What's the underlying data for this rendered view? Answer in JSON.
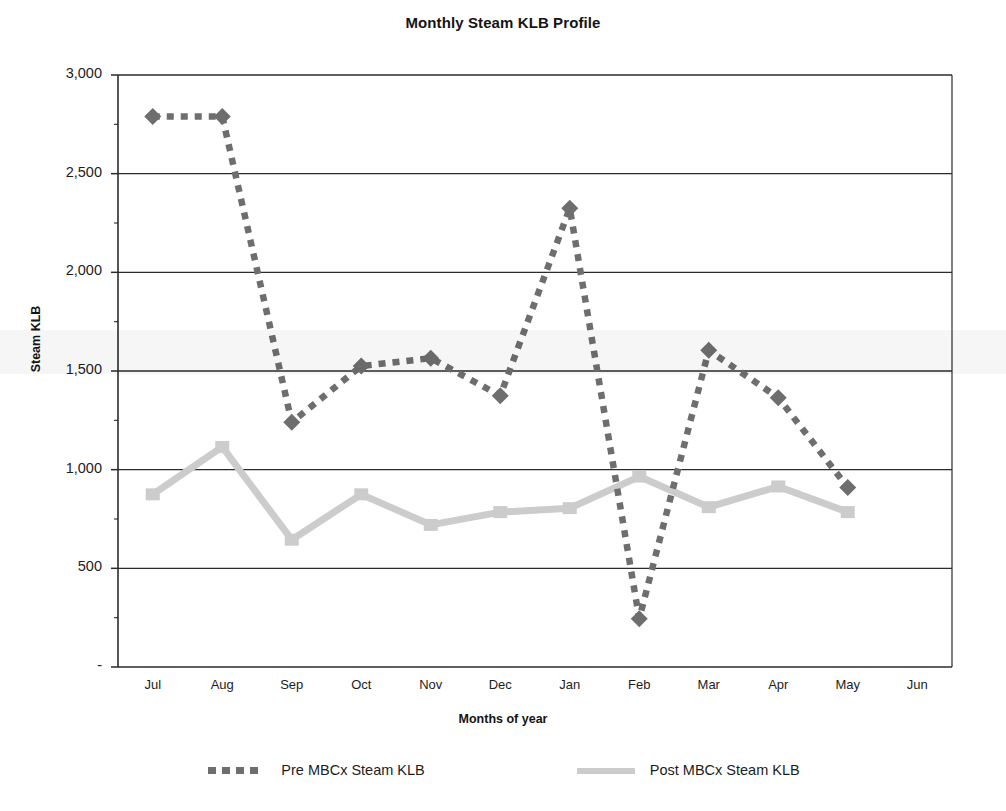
{
  "chart_data": {
    "type": "line",
    "title": "Monthly Steam KLB Profile",
    "xlabel": "Months of year",
    "ylabel": "Steam KLB",
    "categories": [
      "Jul",
      "Aug",
      "Sep",
      "Oct",
      "Nov",
      "Dec",
      "Jan",
      "Feb",
      "Mar",
      "Apr",
      "May",
      "Jun"
    ],
    "ylim": [
      0,
      3000
    ],
    "ytick_values": [
      0,
      500,
      1000,
      1500,
      2000,
      2500,
      3000
    ],
    "ytick_labels": [
      "-",
      "500",
      "1,000",
      "1,500",
      "2,000",
      "2,500",
      "3,000"
    ],
    "grid": true,
    "grid_axis": "y",
    "legend_position": "bottom",
    "series": [
      {
        "name": "Pre MBCx Steam KLB",
        "color": "#6e6e6e",
        "style": "dotted",
        "marker": "diamond",
        "values": [
          2790,
          2790,
          1240,
          1525,
          1565,
          1375,
          2325,
          245,
          1605,
          1365,
          910,
          null
        ]
      },
      {
        "name": "Post MBCx Steam KLB",
        "color": "#cccccc",
        "style": "solid",
        "marker": "square",
        "values": [
          875,
          1115,
          645,
          875,
          720,
          785,
          805,
          965,
          810,
          915,
          785,
          null
        ]
      }
    ]
  },
  "chart": {
    "title": "Monthly Steam KLB Profile",
    "x_axis_title": "Months of year",
    "y_axis_title": "Steam KLB"
  },
  "legend": {
    "items": [
      {
        "label": "Pre MBCx Steam KLB",
        "swatch": "dotted-gray-swatch"
      },
      {
        "label": "Post MBCx Steam KLB",
        "swatch": "solid-lightgray-swatch"
      }
    ]
  },
  "axis": {
    "y_ticks": [
      "3,000",
      "2,500",
      "2,000",
      "1,500",
      "1,000",
      "500",
      "-"
    ],
    "x_ticks": [
      "Jul",
      "Aug",
      "Sep",
      "Oct",
      "Nov",
      "Dec",
      "Jan",
      "Feb",
      "Mar",
      "Apr",
      "May",
      "Jun"
    ]
  },
  "colors": {
    "pre_series": "#6e6e6e",
    "post_series": "#cccccc",
    "gridline": "#2b2b2b",
    "axis": "#2b2b2b",
    "text": "#1d1d1d",
    "background": "#ffffff"
  }
}
